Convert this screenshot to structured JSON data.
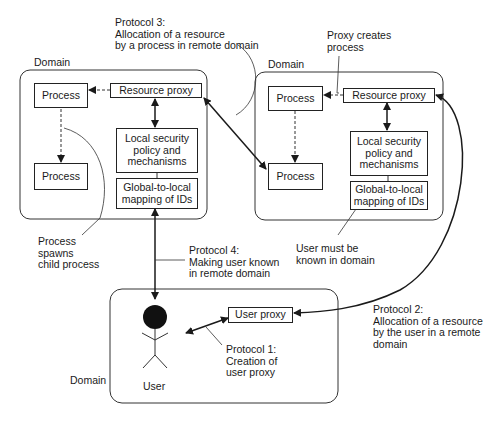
{
  "diagram": {
    "domains": [
      {
        "id": "left-domain",
        "label": "Domain",
        "process_top": "Process",
        "process_bottom": "Process",
        "resource_proxy": "Resource proxy",
        "security_policy": "Local security\npolicy and\nmechanisms",
        "id_mapping": "Global-to-local\nmapping of IDs"
      },
      {
        "id": "right-domain",
        "label": "Domain",
        "process_top": "Process",
        "process_bottom": "Process",
        "resource_proxy": "Resource proxy",
        "security_policy": "Local security\npolicy and\nmechanisms",
        "id_mapping": "Global-to-local\nmapping of IDs"
      },
      {
        "id": "user-domain",
        "label": "Domain",
        "user_proxy": "User proxy",
        "user": "User"
      }
    ],
    "annotations": {
      "protocol_3": "Protocol 3:\nAllocation of a resource\nby a process in remote domain",
      "proxy_creates": "Proxy creates\nprocess",
      "spawns": "Process\nspawns\nchild process",
      "protocol_4": "Protocol 4:\nMaking user known\nin remote domain",
      "user_known": "User must be\nknown in domain",
      "protocol_2": "Protocol 2:\nAllocation of a resource\nby the user in a remote\ndomain",
      "protocol_1": "Protocol 1:\nCreation of\nuser proxy"
    },
    "colors": {
      "line": "#1a1a1a",
      "background": "#ffffff"
    }
  }
}
